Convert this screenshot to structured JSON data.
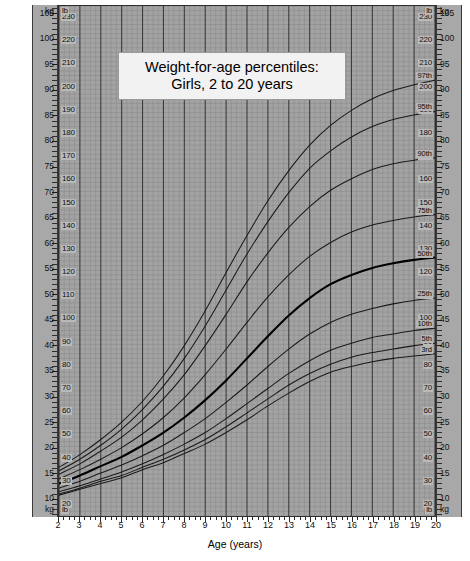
{
  "title": {
    "line1": "Weight-for-age percentiles:",
    "line2": "Girls, 2 to 20 years"
  },
  "axes": {
    "left_unit_top": "kg",
    "left_unit_bottom": "kg",
    "right_unit_top": "kg",
    "right_unit_bottom": "kg",
    "inner_unit_top_left": "lb",
    "inner_unit_top_right": "lb",
    "inner_unit_bottom_left": "lb",
    "inner_unit_bottom_right": "lb",
    "x_title": "Age (years)"
  },
  "colors": {
    "plot_background": "#a3a3a3",
    "gutter_background": "#a8a8a8",
    "grid_minor": "#8a8a8a",
    "grid_major": "#3c3c3c",
    "curve": "#1a1a1a",
    "curve_median": "#000000",
    "title_box": "#f2f2f2",
    "page_background": "#ffffff"
  },
  "chart_data": {
    "type": "line",
    "title": "Weight-for-age percentiles: Girls, 2 to 20 years",
    "xlabel": "Age (years)",
    "ylabel": "Weight",
    "xlim": [
      2,
      20
    ],
    "ylim_lb": [
      15,
      235
    ],
    "ylim_kg": [
      6.8,
      106.6
    ],
    "grid": true,
    "legend": "curve-end labels",
    "x_ticks": [
      2,
      3,
      4,
      5,
      6,
      7,
      8,
      9,
      10,
      11,
      12,
      13,
      14,
      15,
      16,
      17,
      18,
      19,
      20
    ],
    "y_ticks_lb": [
      20,
      30,
      40,
      50,
      60,
      70,
      80,
      90,
      100,
      110,
      120,
      130,
      140,
      150,
      160,
      170,
      180,
      190,
      200,
      210,
      220,
      230
    ],
    "y_ticks_kg": [
      10,
      15,
      20,
      25,
      30,
      35,
      40,
      45,
      50,
      55,
      60,
      65,
      70,
      75,
      80,
      85,
      90,
      95,
      100,
      105
    ],
    "y_ticks_kg_labeled": [
      10,
      15,
      20,
      25,
      30,
      35,
      40,
      45,
      50,
      55,
      60,
      65,
      70,
      75,
      80,
      85,
      90,
      95,
      100,
      105
    ],
    "x": [
      2,
      3,
      4,
      5,
      6,
      7,
      8,
      9,
      10,
      11,
      12,
      13,
      14,
      15,
      16,
      17,
      18,
      19,
      20
    ],
    "series": [
      {
        "name": "97th",
        "label": "97th",
        "values_lb": [
          36.0,
          41.5,
          48.0,
          55.5,
          64.5,
          75.5,
          88.5,
          103.5,
          120.0,
          136.0,
          151.0,
          164.0,
          175.0,
          183.5,
          190.0,
          195.0,
          198.5,
          201.0,
          203.0
        ]
      },
      {
        "name": "95th",
        "label": "95th",
        "values_lb": [
          34.5,
          39.5,
          45.5,
          52.5,
          61.0,
          71.0,
          83.0,
          97.0,
          112.5,
          128.0,
          142.0,
          154.5,
          165.0,
          172.5,
          178.5,
          183.0,
          186.0,
          188.0,
          189.5
        ]
      },
      {
        "name": "90th",
        "label": "90th",
        "values_lb": [
          33.0,
          37.5,
          43.0,
          49.0,
          56.5,
          65.5,
          76.0,
          88.5,
          102.0,
          116.0,
          128.5,
          139.5,
          148.5,
          155.5,
          160.5,
          164.5,
          167.0,
          168.5,
          169.5
        ]
      },
      {
        "name": "75th",
        "label": "75th",
        "values_lb": [
          31.0,
          35.0,
          39.5,
          44.5,
          50.5,
          57.5,
          66.0,
          76.0,
          87.0,
          98.5,
          109.5,
          119.0,
          127.0,
          133.0,
          137.5,
          140.5,
          142.5,
          144.0,
          145.0
        ]
      },
      {
        "name": "50th",
        "label": "50th",
        "values_lb": [
          29.0,
          32.5,
          36.5,
          40.5,
          45.5,
          51.0,
          57.5,
          65.0,
          73.5,
          83.0,
          92.5,
          101.5,
          109.0,
          115.0,
          119.0,
          122.0,
          124.0,
          125.5,
          126.5
        ]
      },
      {
        "name": "25th",
        "label": "25th",
        "values_lb": [
          27.0,
          30.0,
          33.5,
          37.0,
          41.0,
          45.5,
          51.0,
          57.0,
          64.0,
          71.5,
          79.5,
          87.0,
          93.5,
          98.5,
          102.0,
          104.5,
          106.5,
          108.0,
          109.0
        ]
      },
      {
        "name": "10th",
        "label": "10th",
        "values_lb": [
          25.5,
          28.0,
          31.0,
          34.0,
          37.5,
          41.5,
          46.0,
          51.0,
          57.0,
          63.5,
          70.0,
          76.5,
          82.0,
          86.5,
          89.5,
          92.0,
          93.5,
          95.0,
          96.0
        ]
      },
      {
        "name": "5th",
        "label": "5th",
        "values_lb": [
          24.5,
          27.0,
          30.0,
          32.5,
          36.0,
          39.5,
          43.5,
          48.0,
          53.5,
          59.5,
          65.5,
          71.5,
          76.5,
          80.5,
          83.5,
          85.5,
          87.0,
          88.5,
          89.5
        ]
      },
      {
        "name": "3rd",
        "label": "3rd",
        "values_lb": [
          24.0,
          26.5,
          29.0,
          31.5,
          35.0,
          38.0,
          42.0,
          46.0,
          51.0,
          56.5,
          62.5,
          68.0,
          73.0,
          77.0,
          79.5,
          81.5,
          83.0,
          84.0,
          85.0
        ]
      }
    ]
  }
}
